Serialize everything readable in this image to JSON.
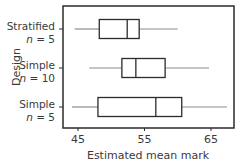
{
  "chart_data": {
    "type": "boxplot",
    "orientation": "horizontal",
    "title": "",
    "xlabel": "Estimated mean mark",
    "ylabel": "Design",
    "xlim": [
      44,
      69
    ],
    "xticks": [
      45,
      55,
      65
    ],
    "grid": false,
    "legend": null,
    "categories": [
      {
        "name": "Stratified",
        "sub": "n = 5"
      },
      {
        "name": "Simple",
        "sub": "n = 10"
      },
      {
        "name": "Simple",
        "sub": "n = 5"
      }
    ],
    "series": [
      {
        "name": "Stratified n = 5",
        "min": 44.5,
        "q1": 48.2,
        "median": 52.4,
        "q3": 54.2,
        "max": 60.0
      },
      {
        "name": "Simple n = 10",
        "min": 46.7,
        "q1": 51.6,
        "median": 53.7,
        "q3": 58.1,
        "max": 64.7
      },
      {
        "name": "Simple n = 5",
        "min": 44.1,
        "q1": 48.0,
        "median": 56.7,
        "q3": 60.6,
        "max": 67.4
      }
    ],
    "colors": {
      "box": "#2b2b2b",
      "whisker": "#8c8c8c",
      "frame": "#2b2b2b",
      "text": "#3a3a3a"
    }
  }
}
